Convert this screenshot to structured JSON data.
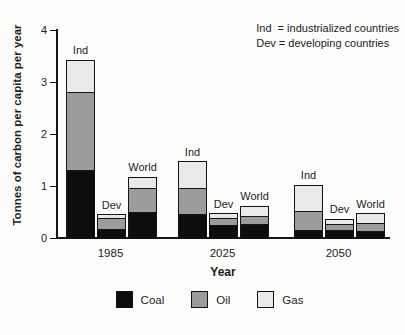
{
  "annotation": {
    "line1": "Ind  = industrialized countries",
    "line2": "Dev = developing countries"
  },
  "colors": {
    "ink": "#1c1c1c",
    "background": "#fcfcfb",
    "coal": "#0d0d0d",
    "oil": "#9c9c9c",
    "gas": "#e9e9e9"
  },
  "chart_data": {
    "type": "bar",
    "stacked": true,
    "title": "",
    "xlabel": "Year",
    "ylabel": "Tonnes of carbon per capita per year",
    "ylim": [
      0,
      4
    ],
    "yticks": [
      0,
      1,
      2,
      3,
      4
    ],
    "grid": false,
    "legend_position": "bottom",
    "categories": [
      "1985",
      "2025",
      "2050"
    ],
    "bars_per_category": [
      "Ind",
      "Dev",
      "World"
    ],
    "stack_order": [
      "Coal",
      "Oil",
      "Gas"
    ],
    "stack_colors": {
      "Coal": "#0d0d0d",
      "Oil": "#9c9c9c",
      "Gas": "#e9e9e9"
    },
    "legend": [
      "Coal",
      "Oil",
      "Gas"
    ],
    "values": {
      "1985": {
        "Ind": {
          "Coal": 1.3,
          "Oil": 1.5,
          "Gas": 0.6
        },
        "Dev": {
          "Coal": 0.16,
          "Oil": 0.21,
          "Gas": 0.06
        },
        "World": {
          "Coal": 0.5,
          "Oil": 0.45,
          "Gas": 0.2
        }
      },
      "2025": {
        "Ind": {
          "Coal": 0.45,
          "Oil": 0.5,
          "Gas": 0.5
        },
        "Dev": {
          "Coal": 0.25,
          "Oil": 0.12,
          "Gas": 0.08
        },
        "World": {
          "Coal": 0.26,
          "Oil": 0.16,
          "Gas": 0.18
        }
      },
      "2050": {
        "Ind": {
          "Coal": 0.15,
          "Oil": 0.37,
          "Gas": 0.48
        },
        "Dev": {
          "Coal": 0.15,
          "Oil": 0.12,
          "Gas": 0.08
        },
        "World": {
          "Coal": 0.13,
          "Oil": 0.15,
          "Gas": 0.17
        }
      }
    }
  }
}
